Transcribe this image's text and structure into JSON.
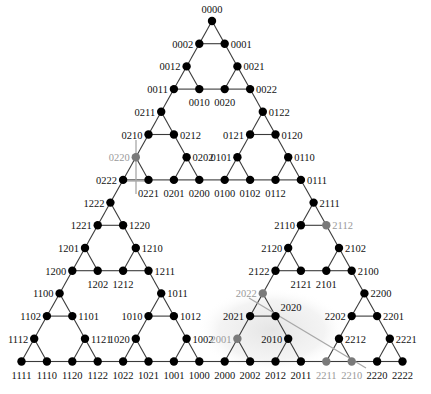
{
  "diagram": {
    "type": "sierpinski-hanoi-graph",
    "geometry": {
      "origin_x": 212,
      "origin_y": 21,
      "half_step_x": 12.7,
      "row_height": 22.7,
      "node_radius": 4.2
    },
    "colors": {
      "node": "#000000",
      "highlight_node": "#7a7a7a",
      "highlight_label": "#9a9a9a",
      "edge": "#3a3a3a",
      "guide": "#a8a8a8",
      "shade": "#e6e6e6"
    },
    "nodes": [
      {
        "id": "0000",
        "r": 0,
        "k": 0,
        "pos": "t"
      },
      {
        "id": "0002",
        "r": 1,
        "k": -1,
        "pos": "l"
      },
      {
        "id": "0001",
        "r": 1,
        "k": 1,
        "pos": "r"
      },
      {
        "id": "0012",
        "r": 2,
        "k": -2,
        "pos": "l"
      },
      {
        "id": "0021",
        "r": 2,
        "k": 2,
        "pos": "r"
      },
      {
        "id": "0011",
        "r": 3,
        "k": -3,
        "pos": "l"
      },
      {
        "id": "0010",
        "r": 3,
        "k": -1,
        "pos": "b"
      },
      {
        "id": "0020",
        "r": 3,
        "k": 1,
        "pos": "b"
      },
      {
        "id": "0022",
        "r": 3,
        "k": 3,
        "pos": "r"
      },
      {
        "id": "0211",
        "r": 4,
        "k": -4,
        "pos": "l"
      },
      {
        "id": "0122",
        "r": 4,
        "k": 4,
        "pos": "r"
      },
      {
        "id": "0210",
        "r": 5,
        "k": -5,
        "pos": "l"
      },
      {
        "id": "0212",
        "r": 5,
        "k": -3,
        "pos": "r"
      },
      {
        "id": "0121",
        "r": 5,
        "k": 3,
        "pos": "l"
      },
      {
        "id": "0120",
        "r": 5,
        "k": 5,
        "pos": "r"
      },
      {
        "id": "0220",
        "r": 6,
        "k": -6,
        "pos": "l",
        "hl": true
      },
      {
        "id": "0202",
        "r": 6,
        "k": -2,
        "pos": "r"
      },
      {
        "id": "0101",
        "r": 6,
        "k": 2,
        "pos": "l"
      },
      {
        "id": "0110",
        "r": 6,
        "k": 6,
        "pos": "r"
      },
      {
        "id": "0222",
        "r": 7,
        "k": -7,
        "pos": "l"
      },
      {
        "id": "0221",
        "r": 7,
        "k": -5,
        "pos": "b"
      },
      {
        "id": "0201",
        "r": 7,
        "k": -3,
        "pos": "b"
      },
      {
        "id": "0200",
        "r": 7,
        "k": -1,
        "pos": "b"
      },
      {
        "id": "0100",
        "r": 7,
        "k": 1,
        "pos": "b"
      },
      {
        "id": "0102",
        "r": 7,
        "k": 3,
        "pos": "b"
      },
      {
        "id": "0112",
        "r": 7,
        "k": 5,
        "pos": "b"
      },
      {
        "id": "0111",
        "r": 7,
        "k": 7,
        "pos": "r"
      },
      {
        "id": "1222",
        "r": 8,
        "k": -8,
        "pos": "l"
      },
      {
        "id": "2111",
        "r": 8,
        "k": 8,
        "pos": "r"
      },
      {
        "id": "1221",
        "r": 9,
        "k": -9,
        "pos": "l"
      },
      {
        "id": "1220",
        "r": 9,
        "k": -7,
        "pos": "r"
      },
      {
        "id": "2110",
        "r": 9,
        "k": 7,
        "pos": "l"
      },
      {
        "id": "2112",
        "r": 9,
        "k": 9,
        "pos": "r",
        "hl": true
      },
      {
        "id": "1201",
        "r": 10,
        "k": -10,
        "pos": "l"
      },
      {
        "id": "1210",
        "r": 10,
        "k": -6,
        "pos": "r"
      },
      {
        "id": "2120",
        "r": 10,
        "k": 6,
        "pos": "l"
      },
      {
        "id": "2102",
        "r": 10,
        "k": 10,
        "pos": "r"
      },
      {
        "id": "1200",
        "r": 11,
        "k": -11,
        "pos": "l"
      },
      {
        "id": "1202",
        "r": 11,
        "k": -9,
        "pos": "b"
      },
      {
        "id": "1212",
        "r": 11,
        "k": -7,
        "pos": "b"
      },
      {
        "id": "1211",
        "r": 11,
        "k": -5,
        "pos": "r"
      },
      {
        "id": "2122",
        "r": 11,
        "k": 5,
        "pos": "l"
      },
      {
        "id": "2121",
        "r": 11,
        "k": 7,
        "pos": "b"
      },
      {
        "id": "2101",
        "r": 11,
        "k": 9,
        "pos": "b"
      },
      {
        "id": "2100",
        "r": 11,
        "k": 11,
        "pos": "r"
      },
      {
        "id": "1100",
        "r": 12,
        "k": -12,
        "pos": "l"
      },
      {
        "id": "1011",
        "r": 12,
        "k": -4,
        "pos": "r"
      },
      {
        "id": "2022",
        "r": 12,
        "k": 4,
        "pos": "l",
        "hl": true
      },
      {
        "id": "2200",
        "r": 12,
        "k": 12,
        "pos": "r"
      },
      {
        "id": "1102",
        "r": 13,
        "k": -13,
        "pos": "l"
      },
      {
        "id": "1101",
        "r": 13,
        "k": -11,
        "pos": "r"
      },
      {
        "id": "1010",
        "r": 13,
        "k": -5,
        "pos": "l"
      },
      {
        "id": "1012",
        "r": 13,
        "k": -3,
        "pos": "r"
      },
      {
        "id": "2021",
        "r": 13,
        "k": 3,
        "pos": "l"
      },
      {
        "id": "2020",
        "r": 13,
        "k": 5,
        "pos": "tr"
      },
      {
        "id": "2202",
        "r": 13,
        "k": 11,
        "pos": "l"
      },
      {
        "id": "2201",
        "r": 13,
        "k": 13,
        "pos": "r"
      },
      {
        "id": "1112",
        "r": 14,
        "k": -14,
        "pos": "l"
      },
      {
        "id": "1121",
        "r": 14,
        "k": -10,
        "pos": "r"
      },
      {
        "id": "1020",
        "r": 14,
        "k": -6,
        "pos": "l"
      },
      {
        "id": "1002",
        "r": 14,
        "k": -2,
        "pos": "r"
      },
      {
        "id": "2001",
        "r": 14,
        "k": 2,
        "pos": "l",
        "hl": true
      },
      {
        "id": "2010",
        "r": 14,
        "k": 6,
        "pos": "l"
      },
      {
        "id": "2212",
        "r": 14,
        "k": 10,
        "pos": "r"
      },
      {
        "id": "2221",
        "r": 14,
        "k": 14,
        "pos": "r"
      },
      {
        "id": "1111",
        "r": 15,
        "k": -15,
        "pos": "b"
      },
      {
        "id": "1110",
        "r": 15,
        "k": -13,
        "pos": "b"
      },
      {
        "id": "1120",
        "r": 15,
        "k": -11,
        "pos": "b"
      },
      {
        "id": "1122",
        "r": 15,
        "k": -9,
        "pos": "b"
      },
      {
        "id": "1022",
        "r": 15,
        "k": -7,
        "pos": "b"
      },
      {
        "id": "1021",
        "r": 15,
        "k": -5,
        "pos": "b"
      },
      {
        "id": "1001",
        "r": 15,
        "k": -3,
        "pos": "b"
      },
      {
        "id": "1000",
        "r": 15,
        "k": -1,
        "pos": "b"
      },
      {
        "id": "2000",
        "r": 15,
        "k": 1,
        "pos": "b"
      },
      {
        "id": "2002",
        "r": 15,
        "k": 3,
        "pos": "b"
      },
      {
        "id": "2012",
        "r": 15,
        "k": 5,
        "pos": "b"
      },
      {
        "id": "2011",
        "r": 15,
        "k": 7,
        "pos": "b"
      },
      {
        "id": "2211",
        "r": 15,
        "k": 9,
        "pos": "b",
        "hl": true
      },
      {
        "id": "2210",
        "r": 15,
        "k": 11,
        "pos": "b",
        "hl": true
      },
      {
        "id": "2220",
        "r": 15,
        "k": 13,
        "pos": "b"
      },
      {
        "id": "2222",
        "r": 15,
        "k": 15,
        "pos": "b"
      }
    ],
    "guides": [
      {
        "x1": 136,
        "y1": 140,
        "x2": 136,
        "y2": 194
      },
      {
        "x1": 120,
        "y1": 181,
        "x2": 152,
        "y2": 181
      },
      {
        "x1": 249,
        "y1": 298,
        "x2": 366,
        "y2": 368
      }
    ],
    "shade": {
      "cx": 272,
      "cy": 330,
      "rx": 75,
      "ry": 42
    }
  }
}
